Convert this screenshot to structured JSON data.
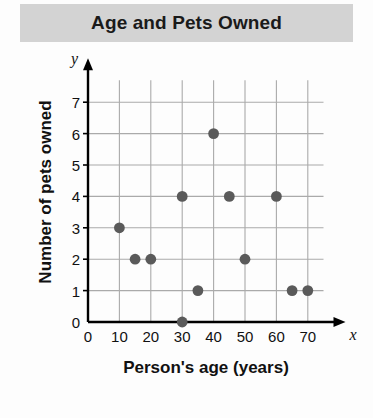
{
  "chart_data": {
    "type": "scatter",
    "title": "Age and Pets Owned",
    "xlabel": "Person's age (years)",
    "ylabel": "Number of pets owned",
    "x_var_symbol": "x",
    "y_var_symbol": "y",
    "xlim": [
      0,
      75
    ],
    "ylim": [
      0,
      7.7
    ],
    "xticks": [
      0,
      10,
      20,
      30,
      40,
      50,
      60,
      70
    ],
    "yticks": [
      0,
      1,
      2,
      3,
      4,
      5,
      6,
      7
    ],
    "xtick_labels": [
      "0",
      "10",
      "20",
      "30",
      "40",
      "50",
      "60",
      "70"
    ],
    "ytick_labels": [
      "0",
      "1",
      "2",
      "3",
      "4",
      "5",
      "6",
      "7"
    ],
    "grid": true,
    "grid_color": "#aaaaaa",
    "axis_color": "#000000",
    "point_color": "#5a5a5a",
    "legend": null,
    "points": [
      {
        "x": 10,
        "y": 3
      },
      {
        "x": 15,
        "y": 2
      },
      {
        "x": 20,
        "y": 2
      },
      {
        "x": 30,
        "y": 0
      },
      {
        "x": 30,
        "y": 4
      },
      {
        "x": 35,
        "y": 1
      },
      {
        "x": 40,
        "y": 6
      },
      {
        "x": 45,
        "y": 4
      },
      {
        "x": 50,
        "y": 2
      },
      {
        "x": 60,
        "y": 4
      },
      {
        "x": 65,
        "y": 1
      },
      {
        "x": 70,
        "y": 1
      }
    ]
  }
}
